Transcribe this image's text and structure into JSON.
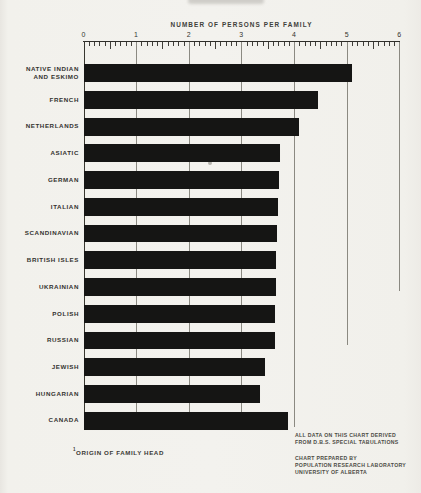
{
  "page": {
    "background": "#f2f1ec",
    "ink": "#151514"
  },
  "chart_data": {
    "type": "bar",
    "orientation": "horizontal",
    "title": "NUMBER OF PERSONS PER FAMILY",
    "xlabel": "NUMBER OF PERSONS PER FAMILY",
    "ylabel": "",
    "xlim": [
      0,
      6
    ],
    "x_ticks": [
      0,
      1,
      2,
      3,
      4,
      5,
      6
    ],
    "minor_tick_step": 0.1,
    "grid": true,
    "bar_color": "#151514",
    "categories": [
      "NATIVE INDIAN\nAND ESKIMO",
      "FRENCH",
      "NETHERLANDS",
      "ASIATIC",
      "GERMAN",
      "ITALIAN",
      "SCANDINAVIAN",
      "BRITISH ISLES",
      "UKRAINIAN",
      "POLISH",
      "RUSSIAN",
      "JEWISH",
      "HUNGARIAN",
      "CANADA"
    ],
    "values": [
      5.1,
      4.45,
      4.1,
      3.74,
      3.72,
      3.7,
      3.68,
      3.66,
      3.66,
      3.64,
      3.64,
      3.45,
      3.36,
      3.89
    ],
    "gridline_bottoms": {
      "1": 429,
      "2": 429,
      "3": 429,
      "4": 427,
      "5": 345,
      "6": 291
    }
  },
  "footer": {
    "footnote_marker": "1",
    "footnote": "ORIGIN OF FAMILY HEAD",
    "source_lines": [
      "ALL DATA ON THIS CHART DERIVED",
      "FROM D.B.S. SPECIAL TABULATIONS"
    ],
    "credit_lines": [
      "CHART PREPARED BY",
      "POPULATION RESEARCH LABORATORY",
      "UNIVERSITY OF ALBERTA"
    ]
  }
}
